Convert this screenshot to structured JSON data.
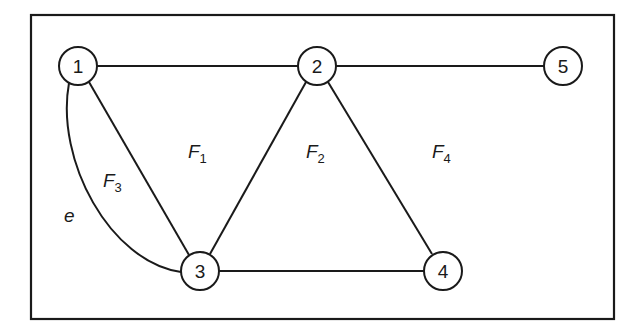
{
  "diagram": {
    "type": "planar-graph",
    "nodes": [
      {
        "id": "1",
        "label": "1",
        "x": 78,
        "y": 66
      },
      {
        "id": "2",
        "label": "2",
        "x": 317,
        "y": 66
      },
      {
        "id": "5",
        "label": "5",
        "x": 563,
        "y": 66
      },
      {
        "id": "3",
        "label": "3",
        "x": 200,
        "y": 271
      },
      {
        "id": "4",
        "label": "4",
        "x": 443,
        "y": 271
      }
    ],
    "edges": [
      {
        "from": "1",
        "to": "2"
      },
      {
        "from": "2",
        "to": "5"
      },
      {
        "from": "1",
        "to": "3"
      },
      {
        "from": "2",
        "to": "3"
      },
      {
        "from": "2",
        "to": "4"
      },
      {
        "from": "3",
        "to": "4"
      },
      {
        "from": "1",
        "to": "3",
        "curved": true,
        "label": "e"
      }
    ],
    "faces": [
      {
        "name": "F",
        "sub": "1",
        "x": 188,
        "y": 158
      },
      {
        "name": "F",
        "sub": "2",
        "x": 306,
        "y": 158
      },
      {
        "name": "F",
        "sub": "3",
        "x": 103,
        "y": 187
      },
      {
        "name": "F",
        "sub": "4",
        "x": 432,
        "y": 158
      }
    ],
    "edge_label": {
      "text": "e",
      "x": 64,
      "y": 222
    },
    "colors": {
      "stroke": "#1a1a1a",
      "background": "#ffffff"
    }
  }
}
